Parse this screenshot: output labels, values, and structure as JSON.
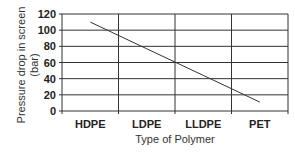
{
  "chart_data": {
    "type": "line",
    "title": "",
    "xlabel": "Type of Polymer",
    "ylabel": "Pressure drop in screen (bar)",
    "ylabel_lines": [
      "Pressure drop in screen",
      "(bar)"
    ],
    "categories": [
      "HDPE",
      "LDPE",
      "LLDPE",
      "PET"
    ],
    "series": [
      {
        "name": "Pressure drop",
        "values": [
          110,
          77,
          44,
          11
        ]
      }
    ],
    "ylim": [
      0,
      120
    ],
    "yticks": [
      0,
      20,
      40,
      60,
      80,
      100,
      120
    ],
    "grid": true,
    "legend": null
  }
}
